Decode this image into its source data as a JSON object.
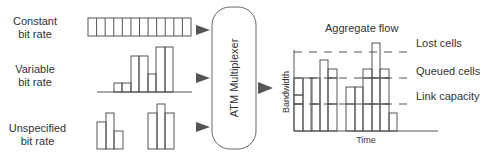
{
  "sources": [
    {
      "id": "cbr",
      "label_line1": "Constant",
      "label_line2": "bit rate"
    },
    {
      "id": "vbr",
      "label_line1": "Variable",
      "label_line2": "bit rate"
    },
    {
      "id": "ubr",
      "label_line1": "Unspecified",
      "label_line2": "bit rate"
    }
  ],
  "multiplexer": {
    "label": "ATM Multiplexer"
  },
  "aggregate": {
    "title": "Aggregate flow",
    "ylabel": "Bandwidth",
    "xlabel": "Time",
    "thresholds": [
      {
        "label": "Lost cells"
      },
      {
        "label": "Queued cells"
      },
      {
        "label": "Link capacity"
      }
    ]
  },
  "colors": {
    "stroke": "#555555",
    "arrow": "#555555",
    "text": "#333333"
  }
}
